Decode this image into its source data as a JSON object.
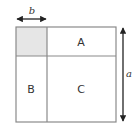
{
  "diagram": {
    "type": "area-model-square",
    "regions": [
      {
        "id": "shaded",
        "label": "",
        "fill": "#e6e6e6"
      },
      {
        "id": "A",
        "label": "A"
      },
      {
        "id": "B",
        "label": "B"
      },
      {
        "id": "C",
        "label": "C"
      }
    ],
    "dimensions": {
      "top": {
        "label": "b",
        "spans": "shaded square width"
      },
      "right": {
        "label": "a",
        "spans": "full square height"
      }
    },
    "colors": {
      "stroke": "#8a8a8a",
      "shaded": "#e6e6e6",
      "arrow": "#222222",
      "background": "#ffffff"
    }
  }
}
